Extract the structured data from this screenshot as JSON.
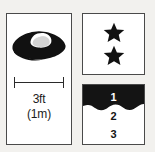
{
  "figure": {
    "background_color": "#f2f1ee",
    "ink_color": "#1c1c1c",
    "panel_border_color": "#4a4a4a",
    "panel_fill_color": "#ffffff"
  },
  "scale_panel": {
    "object_icon": "flying-saucer-icon",
    "measure_bar_label": "size-scale-bar",
    "size_imperial": "3ft",
    "size_metric": "(1m)"
  },
  "rating_panel": {
    "star_icon": "star-icon",
    "star_count": 2,
    "stars": [
      "star-filled",
      "star-filled"
    ]
  },
  "depth_panel": {
    "fill_color": "#141414",
    "levels": [
      {
        "number": "1",
        "text_color": "#ffffff"
      },
      {
        "number": "2",
        "text_color": "#141414"
      },
      {
        "number": "3",
        "text_color": "#141414"
      }
    ]
  }
}
